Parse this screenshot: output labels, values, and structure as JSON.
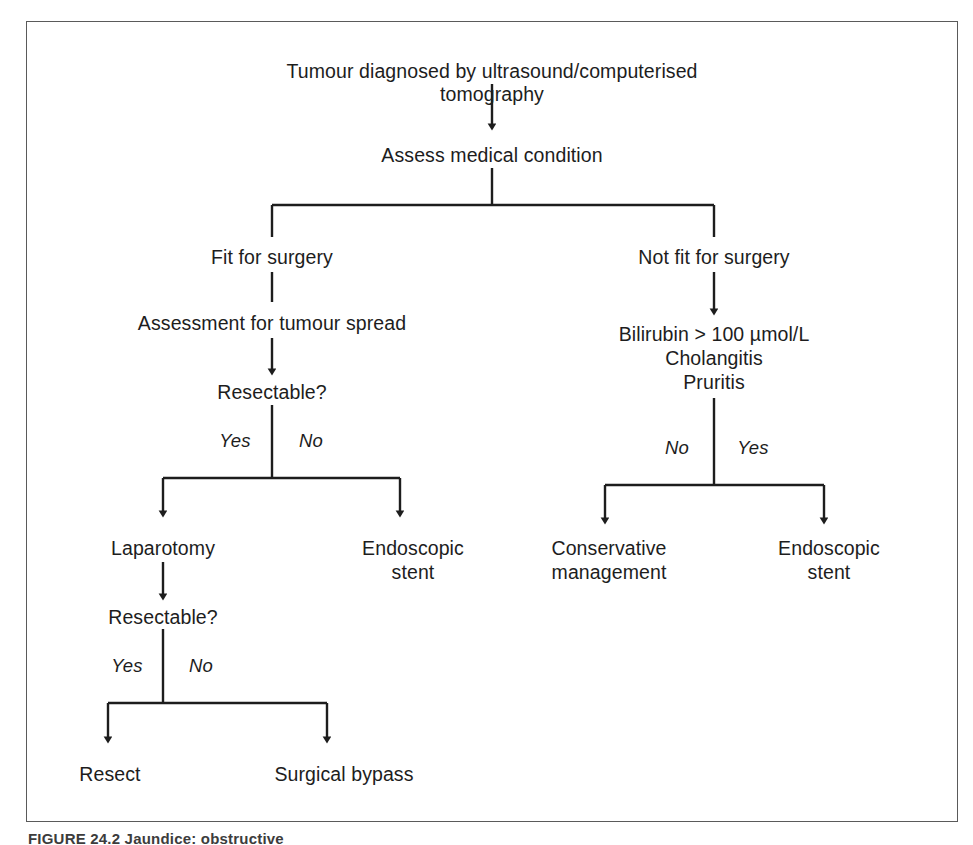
{
  "figure": {
    "caption": "FIGURE 24.2  Jaundice: obstructive",
    "frame_color": "#5a5a5a",
    "line_color": "#1d1d1d",
    "text_color": "#1d1d1d"
  },
  "nodes": {
    "root": "Tumour diagnosed by ultrasound/computerised tomography",
    "assess": "Assess medical condition",
    "fit": "Fit for surgery",
    "not_fit": "Not fit for surgery",
    "assessment_spread": "Assessment for tumour spread",
    "resectable_1": "Resectable?",
    "criteria_line1": "Bilirubin > 100 µmol/L",
    "criteria_line2": "Cholangitis",
    "criteria_line3": "Pruritis",
    "laparotomy": "Laparotomy",
    "endoscopic_stent_left_line1": "Endoscopic",
    "endoscopic_stent_left_line2": "stent",
    "conservative_line1": "Conservative",
    "conservative_line2": "management",
    "endoscopic_stent_right_line1": "Endoscopic",
    "endoscopic_stent_right_line2": "stent",
    "resectable_2": "Resectable?",
    "resect": "Resect",
    "surgical_bypass": "Surgical bypass"
  },
  "edge_labels": {
    "left_yes_1": "Yes",
    "left_no_1": "No",
    "right_no": "No",
    "right_yes": "Yes",
    "left_yes_2": "Yes",
    "left_no_2": "No"
  },
  "flow": {
    "type": "decision-tree",
    "title": "Jaundice: obstructive management algorithm",
    "edges": [
      {
        "from": "root",
        "to": "assess",
        "label": "",
        "arrow": true
      },
      {
        "from": "assess",
        "to": "fit",
        "label": "",
        "arrow": false
      },
      {
        "from": "assess",
        "to": "not_fit",
        "label": "",
        "arrow": false
      },
      {
        "from": "fit",
        "to": "assessment_spread",
        "label": "",
        "arrow": false
      },
      {
        "from": "assessment_spread",
        "to": "resectable_1",
        "label": "",
        "arrow": true
      },
      {
        "from": "resectable_1",
        "to": "laparotomy",
        "label": "Yes",
        "arrow": true
      },
      {
        "from": "resectable_1",
        "to": "endoscopic_stent_left",
        "label": "No",
        "arrow": true
      },
      {
        "from": "laparotomy",
        "to": "resectable_2",
        "label": "",
        "arrow": true
      },
      {
        "from": "resectable_2",
        "to": "resect",
        "label": "Yes",
        "arrow": true
      },
      {
        "from": "resectable_2",
        "to": "surgical_bypass",
        "label": "No",
        "arrow": true
      },
      {
        "from": "not_fit",
        "to": "criteria",
        "label": "",
        "arrow": true
      },
      {
        "from": "criteria",
        "to": "conservative",
        "label": "No",
        "arrow": true
      },
      {
        "from": "criteria",
        "to": "endoscopic_stent_right",
        "label": "Yes",
        "arrow": true
      }
    ]
  }
}
